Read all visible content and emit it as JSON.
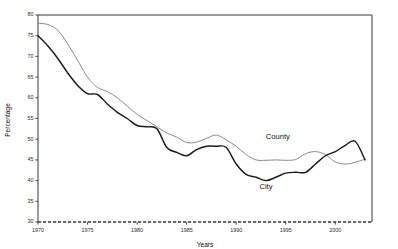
{
  "chart_data": {
    "type": "line",
    "title": "",
    "xlabel": "Years",
    "ylabel": "Percentage",
    "xlim": [
      1970,
      2003.7
    ],
    "ylim": [
      30,
      80
    ],
    "grid": false,
    "legend": "inline-annotations",
    "xticks": [
      1970,
      1975,
      1980,
      1985,
      1990,
      1995,
      2000
    ],
    "xticklabels": [
      "1970",
      "1975",
      "1980",
      "1985",
      "1990",
      "1995",
      "2000"
    ],
    "yticks": [
      30,
      35,
      40,
      45,
      50,
      55,
      60,
      65,
      70,
      75,
      80
    ],
    "yticklabels": [
      "30",
      "35",
      "40",
      "45",
      "50",
      "55",
      "60",
      "65",
      "70",
      "75",
      "80"
    ],
    "x": [
      1970,
      1971,
      1972,
      1973,
      1974,
      1975,
      1976,
      1977,
      1978,
      1979,
      1980,
      1981,
      1982,
      1983,
      1984,
      1985,
      1986,
      1987,
      1988,
      1989,
      1990,
      1991,
      1992,
      1993,
      1994,
      1995,
      1996,
      1997,
      1998,
      1999,
      2000,
      2001,
      2002,
      2003
    ],
    "series": [
      {
        "name": "County",
        "color": "#8c8c8c",
        "label_text": "County",
        "values": [
          78.0,
          77.7,
          76.3,
          73.0,
          69.0,
          65.0,
          62.5,
          61.5,
          60.0,
          58.0,
          56.0,
          54.5,
          53.0,
          51.5,
          50.5,
          49.2,
          49.3,
          50.2,
          51.0,
          49.8,
          48.3,
          46.3,
          45.0,
          44.9,
          45.0,
          44.9,
          45.1,
          46.5,
          47.0,
          46.3,
          44.5,
          44.0,
          44.4,
          45.2
        ]
      },
      {
        "name": "City",
        "color": "#1a1a1a",
        "label_text": "City",
        "values": [
          75.0,
          72.5,
          69.5,
          66.0,
          63.0,
          61.0,
          60.8,
          58.5,
          56.5,
          55.0,
          53.3,
          53.0,
          52.5,
          48.0,
          46.8,
          46.0,
          47.5,
          48.3,
          48.3,
          48.0,
          44.0,
          41.5,
          40.8,
          40.0,
          40.8,
          41.8,
          42.0,
          42.0,
          44.0,
          46.0,
          47.0,
          48.5,
          49.5,
          45.0
        ]
      }
    ],
    "annotations": [
      {
        "text": "County",
        "x": 1994.2,
        "y": 50.0
      },
      {
        "text": "City",
        "x": 1993.0,
        "y": 38.0
      }
    ]
  },
  "axes": {
    "y_axis_title": "Percentage",
    "x_axis_title": "Years"
  }
}
